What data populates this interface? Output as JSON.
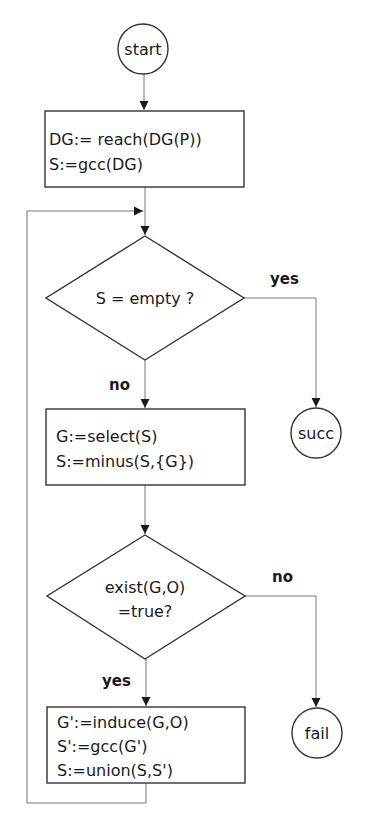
{
  "diagram": {
    "type": "flowchart",
    "nodes": {
      "start": {
        "shape": "circle",
        "label": "start"
      },
      "init": {
        "shape": "rect",
        "lines": [
          "DG:= reach(DG(P))",
          "S:=gcc(DG)"
        ]
      },
      "check_empty": {
        "shape": "diamond",
        "lines": [
          "S = empty ?"
        ]
      },
      "succ": {
        "shape": "circle",
        "label": "succ"
      },
      "select": {
        "shape": "rect",
        "lines": [
          "G:=select(S)",
          "S:=minus(S,{G})"
        ]
      },
      "check_exist": {
        "shape": "diamond",
        "lines": [
          "exist(G,O)",
          "=true?"
        ]
      },
      "fail": {
        "shape": "circle",
        "label": "fail"
      },
      "induce": {
        "shape": "rect",
        "lines": [
          "G':=induce(G,O)",
          "S':=gcc(G')",
          "S:=union(S,S')"
        ]
      }
    },
    "edges": [
      {
        "from": "start",
        "to": "init",
        "label": ""
      },
      {
        "from": "init",
        "to": "check_empty",
        "label": ""
      },
      {
        "from": "check_empty",
        "to": "succ",
        "label": "yes"
      },
      {
        "from": "check_empty",
        "to": "select",
        "label": "no"
      },
      {
        "from": "select",
        "to": "check_exist",
        "label": ""
      },
      {
        "from": "check_exist",
        "to": "fail",
        "label": "no"
      },
      {
        "from": "check_exist",
        "to": "induce",
        "label": "yes"
      },
      {
        "from": "induce",
        "to": "check_empty",
        "label": ""
      }
    ],
    "colors": {
      "shape_stroke": "#333333",
      "edge_stroke": "#777777",
      "text": "#1a1a1a",
      "background": "#ffffff"
    }
  }
}
